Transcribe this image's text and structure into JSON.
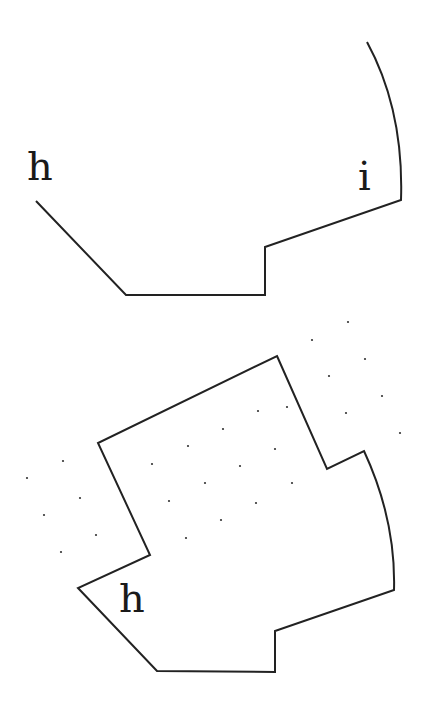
{
  "diagram": {
    "stroke_color": "#222222",
    "dot_color": "#333333",
    "top_figure": {
      "label_left": "h",
      "label_right": "i"
    },
    "bottom_figure": {
      "label": "h"
    },
    "dots": [
      [
        348,
        322
      ],
      [
        312,
        340
      ],
      [
        365,
        359
      ],
      [
        329,
        376
      ],
      [
        382,
        396
      ],
      [
        346,
        413
      ],
      [
        400,
        433
      ],
      [
        287,
        407
      ],
      [
        258,
        411
      ],
      [
        223,
        429
      ],
      [
        275,
        449
      ],
      [
        188,
        446
      ],
      [
        240,
        466
      ],
      [
        292,
        483
      ],
      [
        152,
        464
      ],
      [
        205,
        483
      ],
      [
        256,
        503
      ],
      [
        169,
        501
      ],
      [
        221,
        520
      ],
      [
        186,
        538
      ],
      [
        63,
        461
      ],
      [
        27,
        478
      ],
      [
        80,
        498
      ],
      [
        44,
        515
      ],
      [
        96,
        535
      ],
      [
        61,
        552
      ]
    ]
  }
}
